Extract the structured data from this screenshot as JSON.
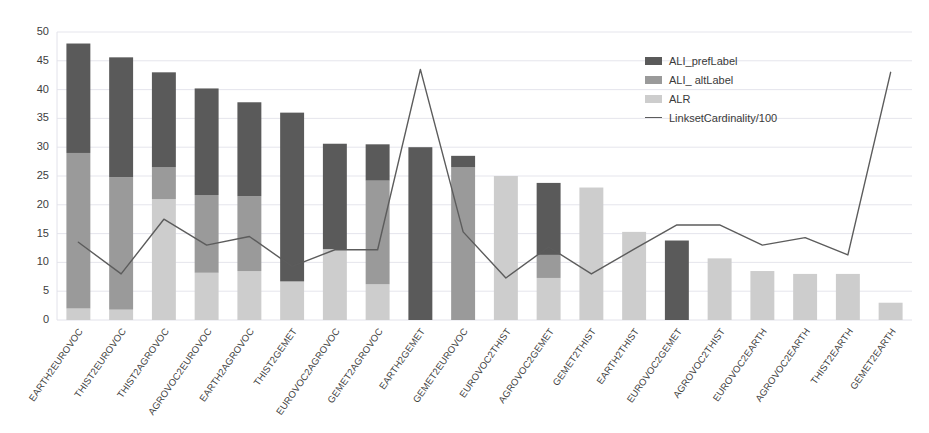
{
  "chart_data": {
    "type": "bar",
    "subtype": "stacked-bar-with-line",
    "title": "",
    "xlabel": "",
    "ylabel": "",
    "ylim": [
      0,
      50
    ],
    "yticks": [
      0,
      5,
      10,
      15,
      20,
      25,
      30,
      35,
      40,
      45,
      50
    ],
    "grid": true,
    "legend_position": "upper-right",
    "categories": [
      "EARTH2EUROVOC",
      "THIST2EUROVOC",
      "THIST2AGROVOC",
      "AGROVOC2EUROVOC",
      "EARTH2AGROVOC",
      "THIST2GEMET",
      "EUROVOC2AGROVOC",
      "GEMET2AGROVOC",
      "EARTH2GEMET",
      "GEMET2EUROVOC",
      "EUROVOC2THIST",
      "AGROVOC2GEMET",
      "GEMET2THIST",
      "EARTH2THIST",
      "EUROVOC2GEMET",
      "AGROVOC2THIST",
      "EUROVOC2EARTH",
      "AGROVOC2EARTH",
      "THIST2EARTH",
      "GEMET2EARTH"
    ],
    "series": [
      {
        "name": "ALI_prefLabel",
        "color": "#5a5a5a",
        "values": [
          19.0,
          20.8,
          16.5,
          18.5,
          16.3,
          29.3,
          18.3,
          6.3,
          30.0,
          2.0,
          0.0,
          12.5,
          0.0,
          0.0,
          13.8,
          0.0,
          0.0,
          0.0,
          0.0,
          0.0
        ]
      },
      {
        "name": "ALI_ altLabel",
        "color": "#9a9a9a",
        "values": [
          27.0,
          23.0,
          5.5,
          13.5,
          13.0,
          0.0,
          0.0,
          18.0,
          0.0,
          26.5,
          0.0,
          4.0,
          0.0,
          0.0,
          0.0,
          0.0,
          0.0,
          0.0,
          0.0,
          0.0
        ]
      },
      {
        "name": "ALR",
        "color": "#cdcdcd",
        "values": [
          2.0,
          1.8,
          21.0,
          8.2,
          8.5,
          6.7,
          12.3,
          6.2,
          0.0,
          0.0,
          25.0,
          7.3,
          23.0,
          15.3,
          0.0,
          10.7,
          8.5,
          8.0,
          8.0,
          3.0
        ]
      }
    ],
    "line_series": {
      "name": "LinksetCardinality/100",
      "color": "#5c5c5c",
      "values": [
        13.5,
        8.0,
        17.5,
        13.0,
        14.5,
        9.3,
        12.2,
        12.2,
        43.5,
        15.3,
        7.3,
        12.7,
        8.0,
        12.3,
        16.5,
        16.5,
        13.0,
        14.3,
        11.3,
        43.0
      ]
    },
    "bar_totals": [
      48.0,
      45.6,
      43.0,
      40.2,
      37.8,
      36.0,
      30.6,
      30.5,
      30.0,
      28.5,
      25.0,
      23.8,
      23.0,
      15.3,
      13.8,
      10.7,
      8.5,
      8.0,
      8.0,
      3.0
    ]
  },
  "legend": {
    "items": [
      {
        "label": "ALI_prefLabel",
        "marker": "swatch"
      },
      {
        "label": "ALI_ altLabel",
        "marker": "swatch"
      },
      {
        "label": "ALR",
        "marker": "swatch"
      },
      {
        "label": "LinksetCardinality/100",
        "marker": "line"
      }
    ]
  },
  "colors": {
    "pref_label": "#5a5a5a",
    "alt_label": "#9a9a9a",
    "alr": "#cdcdcd",
    "line": "#5c5c5c",
    "grid": "#e2e2ea",
    "text": "#3d3d3d",
    "background": "#ffffff"
  }
}
